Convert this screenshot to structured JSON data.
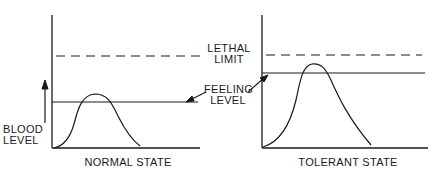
{
  "diagram": {
    "colors": {
      "ink": "#1a1a1a",
      "background": "#ffffff"
    },
    "y_axis_label_line1": "BLOOD",
    "y_axis_label_line2": "LEVEL",
    "lethal_label_line1": "LETHAL",
    "lethal_label_line2": "LIMIT",
    "feeling_label_line1": "FEELING",
    "feeling_label_line2": "LEVEL",
    "panels": [
      {
        "title": "NORMAL STATE",
        "description": "Blood level curve peaks just above feeling level; lethal limit well above"
      },
      {
        "title": "TOLERANT STATE",
        "description": "Feeling level raised closer to lethal limit; blood level curve peaks higher"
      }
    ]
  }
}
